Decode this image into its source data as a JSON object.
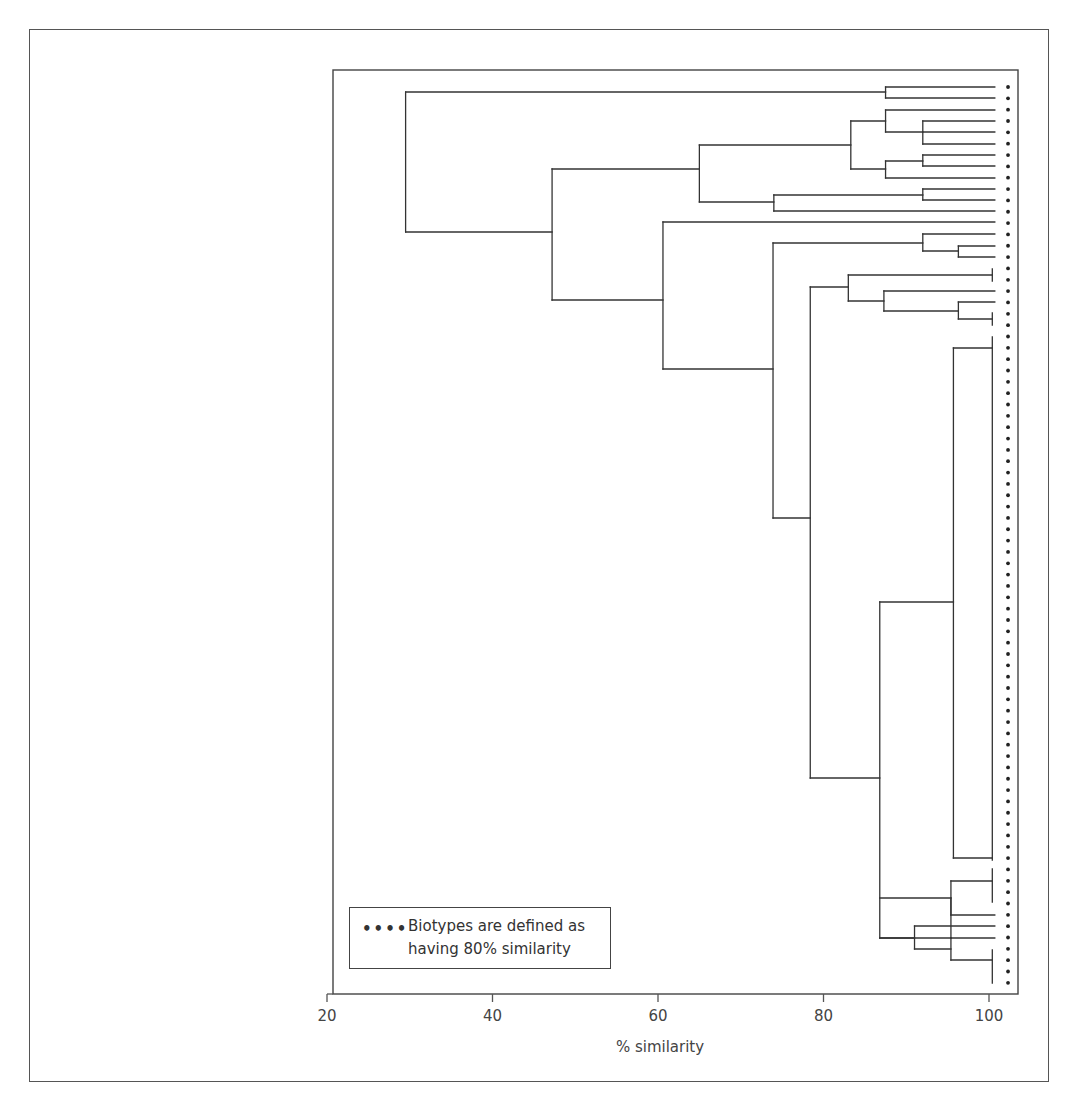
{
  "chart_data": {
    "type": "dendrogram",
    "title": "",
    "xlabel": "% similarity",
    "ylabel": "",
    "xlim": [
      20,
      103.5
    ],
    "xticks": [
      20,
      40,
      60,
      80,
      100
    ],
    "tick_labels": [
      "20",
      "40",
      "60",
      "80",
      "100"
    ],
    "grid": false,
    "legend": {
      "marker": "••••",
      "line1": "Biotypes are defined as",
      "line2": "having 80% similarity",
      "position": "bottom-left"
    },
    "threshold_line": {
      "style": "dotted",
      "meaning": "Biotypes are defined as having 80% similarity"
    },
    "leaf_end_x": 100.7,
    "segments_note": "Each segment: [x1, y1, x2, y2] with x in % similarity and y in pixel rows",
    "segments": [
      [
        29.5,
        92,
        87.5,
        92
      ],
      [
        29.5,
        92,
        29.5,
        232
      ],
      [
        29.5,
        232,
        47.2,
        232
      ],
      [
        87.5,
        87,
        87.5,
        98
      ],
      [
        87.5,
        87,
        100.7,
        87
      ],
      [
        87.5,
        98,
        100.7,
        98
      ],
      [
        47.2,
        169,
        47.2,
        300
      ],
      [
        47.2,
        169,
        65.0,
        169
      ],
      [
        47.2,
        300,
        60.6,
        300
      ],
      [
        65.0,
        145,
        65.0,
        202
      ],
      [
        65.0,
        145,
        83.3,
        145
      ],
      [
        65.0,
        202,
        74.0,
        202
      ],
      [
        83.3,
        121,
        83.3,
        169
      ],
      [
        83.3,
        121,
        87.5,
        121
      ],
      [
        83.3,
        169,
        87.5,
        169
      ],
      [
        87.5,
        110,
        87.5,
        132
      ],
      [
        87.5,
        110,
        100.7,
        110
      ],
      [
        87.5,
        132,
        92.0,
        132
      ],
      [
        92.0,
        121,
        92.0,
        144
      ],
      [
        92.0,
        121,
        100.7,
        121
      ],
      [
        92.0,
        132,
        100.7,
        132
      ],
      [
        92.0,
        144,
        100.7,
        144
      ],
      [
        87.5,
        161,
        87.5,
        178
      ],
      [
        87.5,
        161,
        92.0,
        161
      ],
      [
        87.5,
        178,
        100.7,
        178
      ],
      [
        92.0,
        155,
        92.0,
        166
      ],
      [
        92.0,
        155,
        100.7,
        155
      ],
      [
        92.0,
        166,
        100.7,
        166
      ],
      [
        74.0,
        195,
        74.0,
        211
      ],
      [
        74.0,
        195,
        92.0,
        195
      ],
      [
        74.0,
        211,
        100.7,
        211
      ],
      [
        92.0,
        189,
        92.0,
        200
      ],
      [
        92.0,
        189,
        100.7,
        189
      ],
      [
        92.0,
        200,
        100.7,
        200
      ],
      [
        60.6,
        222,
        60.6,
        369
      ],
      [
        60.6,
        222,
        100.7,
        222
      ],
      [
        60.6,
        369,
        73.9,
        369
      ],
      [
        73.9,
        243,
        73.9,
        518
      ],
      [
        73.9,
        243,
        92.0,
        243
      ],
      [
        73.9,
        518,
        78.4,
        518
      ],
      [
        92.0,
        234,
        92.0,
        251
      ],
      [
        92.0,
        234,
        100.7,
        234
      ],
      [
        92.0,
        251,
        96.3,
        251
      ],
      [
        96.3,
        246,
        96.3,
        257
      ],
      [
        96.3,
        246,
        100.7,
        246
      ],
      [
        96.3,
        257,
        100.7,
        257
      ],
      [
        78.4,
        287,
        78.4,
        778
      ],
      [
        78.4,
        287,
        83.0,
        287
      ],
      [
        78.4,
        778,
        86.8,
        778
      ],
      [
        83.0,
        275,
        83.0,
        301
      ],
      [
        83.0,
        275,
        100.4,
        275
      ],
      [
        100.4,
        269,
        100.4,
        281
      ],
      [
        83.0,
        301,
        87.3,
        301
      ],
      [
        87.3,
        291,
        87.3,
        311
      ],
      [
        87.3,
        291,
        100.7,
        291
      ],
      [
        87.3,
        311,
        96.3,
        311
      ],
      [
        96.3,
        302,
        96.3,
        319
      ],
      [
        96.3,
        302,
        100.7,
        302
      ],
      [
        96.3,
        319,
        100.4,
        319
      ],
      [
        100.4,
        313,
        100.4,
        325
      ],
      [
        86.8,
        602,
        86.8,
        938
      ],
      [
        86.8,
        602,
        95.7,
        602
      ],
      [
        86.8,
        938,
        95.4,
        938
      ],
      [
        95.7,
        348,
        95.7,
        858
      ],
      [
        95.7,
        348,
        100.4,
        348
      ],
      [
        95.7,
        858,
        100.4,
        858
      ],
      [
        100.4,
        337,
        100.4,
        860
      ],
      [
        95.4,
        898,
        95.4,
        938
      ],
      [
        86.8,
        898,
        95.4,
        898
      ],
      [
        95.4,
        881,
        95.4,
        915
      ],
      [
        95.4,
        881,
        100.4,
        881
      ],
      [
        100.4,
        869,
        100.4,
        902
      ],
      [
        95.4,
        915,
        100.7,
        915
      ],
      [
        91.0,
        926,
        91.0,
        949
      ],
      [
        86.8,
        938,
        91.0,
        938
      ],
      [
        91.0,
        926,
        100.7,
        926
      ],
      [
        91.0,
        949,
        95.4,
        949
      ],
      [
        95.4,
        938,
        95.4,
        960
      ],
      [
        95.4,
        938,
        100.7,
        938
      ],
      [
        95.4,
        960,
        100.4,
        960
      ],
      [
        100.4,
        950,
        100.4,
        983
      ]
    ],
    "dots": {
      "x": 102.3,
      "y_start": 87,
      "y_step": 11.34,
      "count": 80
    }
  },
  "plot_area": {
    "left_px": 333,
    "top_px": 70,
    "right_px": 1018,
    "bottom_px": 994
  },
  "axis_mapping": {
    "x20_px": 327,
    "x100_px": 989
  },
  "colors": {
    "line": "#333333",
    "frame": "#555555",
    "dots": "#222222",
    "text": "#444444"
  }
}
